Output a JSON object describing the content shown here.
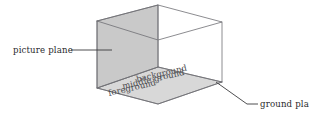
{
  "figure": {
    "background_color": "#ffffff",
    "line_color": "#6f6f73",
    "picture_plane_fill": "#c9c9c9",
    "ground_plane_fill": "#d8d8d8"
  },
  "callouts": [
    {
      "id": "picture-plane",
      "label": "picture plane",
      "position": "left",
      "leader": "horizontal line from label to shaded vertical face"
    },
    {
      "id": "ground-plane",
      "label": "ground plane",
      "position": "bottom-right",
      "leader": "diagonal line from box base corner to label"
    }
  ],
  "ground_labels": [
    {
      "id": "background",
      "label": "background"
    },
    {
      "id": "middle-ground",
      "label": "middle ground"
    },
    {
      "id": "foreground",
      "label": "foreground"
    }
  ]
}
